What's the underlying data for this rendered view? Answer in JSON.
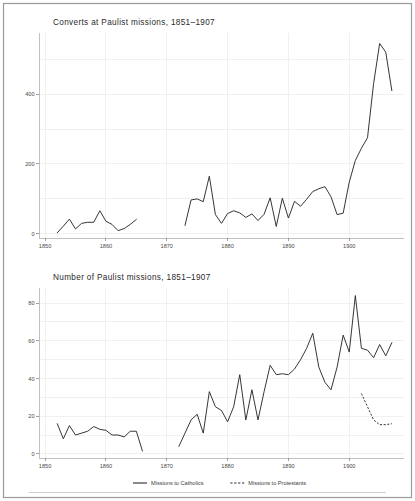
{
  "figure": {
    "width": 415,
    "height": 501,
    "background": "#ffffff",
    "border_color": "#9a9a9a",
    "line_color": "#2b2b2b",
    "grid_color": "#e9e9e9"
  },
  "legend": {
    "position": "bottom",
    "entries": [
      {
        "label": "Missions to Catholics",
        "style": "solid",
        "key_name": "legend-key-catholics"
      },
      {
        "label": "Missions to Protestants",
        "style": "dashed",
        "key_name": "legend-key-protestants"
      }
    ]
  },
  "chart_data": [
    {
      "id": "converts",
      "type": "line",
      "title": "Converts at Paulist missions, 1851–1907",
      "xlabel": "",
      "ylabel": "",
      "xlim": [
        1849,
        1909
      ],
      "ylim": [
        -12,
        575
      ],
      "xticks": [
        1850,
        1860,
        1870,
        1880,
        1890,
        1900
      ],
      "xtick_labels": [
        "1850",
        "1860",
        "1870",
        "1880",
        "1890",
        "1900"
      ],
      "yticks": [
        0,
        200,
        400
      ],
      "ytick_labels": [
        "0",
        "200",
        "400"
      ],
      "yminor": [
        100,
        300,
        500
      ],
      "grid": true,
      "series": [
        {
          "name": "Missions to Catholics",
          "style": "solid",
          "segments": [
            {
              "x": [
                1852,
                1853,
                1854,
                1855,
                1856,
                1857,
                1858,
                1859,
                1860,
                1861,
                1862,
                1863,
                1864,
                1865
              ],
              "y": [
                3,
                22,
                42,
                14,
                30,
                33,
                33,
                66,
                36,
                27,
                9,
                15,
                27,
                41
              ]
            },
            {
              "x": [
                1873,
                1874,
                1875,
                1876,
                1877,
                1878,
                1879,
                1880,
                1881,
                1882,
                1883,
                1884,
                1885,
                1886,
                1887,
                1888,
                1889,
                1890,
                1891,
                1892,
                1893,
                1894,
                1895,
                1896,
                1897,
                1898,
                1899,
                1900,
                1901,
                1902,
                1903,
                1904,
                1905,
                1906,
                1907
              ],
              "y": [
                24,
                97,
                100,
                92,
                165,
                55,
                30,
                58,
                66,
                60,
                47,
                57,
                38,
                56,
                103,
                21,
                102,
                45,
                93,
                79,
                99,
                121,
                129,
                135,
                106,
                55,
                59,
                148,
                210,
                245,
                275,
                430,
                545,
                520,
                410
              ]
            }
          ]
        }
      ]
    },
    {
      "id": "missions",
      "type": "line",
      "title": "Number of Paulist missions, 1851–1907",
      "xlabel": "",
      "ylabel": "",
      "xlim": [
        1849,
        1909
      ],
      "ylim": [
        -2.2,
        88
      ],
      "xticks": [
        1850,
        1860,
        1870,
        1880,
        1890,
        1900
      ],
      "xtick_labels": [
        "1850",
        "1860",
        "1870",
        "1880",
        "1890",
        "1900"
      ],
      "yticks": [
        0,
        20,
        40,
        60,
        80
      ],
      "ytick_labels": [
        "0",
        "20",
        "40",
        "60",
        "80"
      ],
      "yminor": [
        10,
        30,
        50,
        70
      ],
      "grid": true,
      "series": [
        {
          "name": "Missions to Catholics",
          "style": "solid",
          "segments": [
            {
              "x": [
                1852,
                1853,
                1854,
                1855,
                1856,
                1857,
                1858,
                1859,
                1860,
                1861,
                1862,
                1863,
                1864,
                1865,
                1866
              ],
              "y": [
                16,
                8,
                15,
                10,
                11,
                12,
                14.5,
                13,
                12.5,
                10,
                10,
                9,
                12,
                12,
                1.5
              ]
            },
            {
              "x": [
                1872,
                1873,
                1874,
                1875,
                1876,
                1877,
                1878,
                1879,
                1880,
                1881,
                1882,
                1883,
                1884,
                1885,
                1886,
                1887,
                1888,
                1889,
                1890,
                1891,
                1892,
                1893,
                1894,
                1895,
                1896,
                1897,
                1898,
                1899,
                1900,
                1901,
                1902,
                1903,
                1904,
                1905,
                1906,
                1907
              ],
              "y": [
                4,
                11,
                18,
                21,
                11,
                33,
                25,
                23,
                17,
                25,
                42,
                18,
                34,
                18,
                33,
                47,
                42,
                42.5,
                42,
                45,
                50,
                56,
                64,
                46,
                38,
                34,
                46,
                63,
                54,
                84,
                56,
                55,
                51,
                58,
                52,
                59
              ]
            }
          ]
        },
        {
          "name": "Missions to Protestants",
          "style": "dashed",
          "segments": [
            {
              "x": [
                1902,
                1903,
                1904,
                1905,
                1906,
                1907
              ],
              "y": [
                32,
                25,
                18,
                15.5,
                15.5,
                16
              ]
            }
          ]
        }
      ]
    }
  ]
}
